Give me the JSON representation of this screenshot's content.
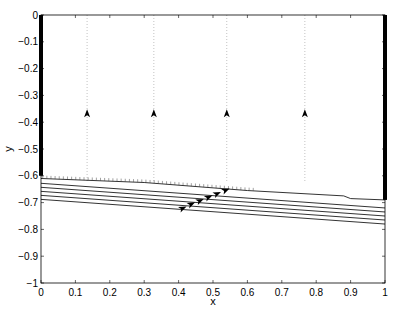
{
  "chart_data": {
    "type": "line",
    "title": "",
    "xlabel": "x",
    "ylabel": "y",
    "xlim": [
      0,
      1
    ],
    "ylim": [
      -1,
      0
    ],
    "grid": false,
    "x_ticks": [
      "0",
      "0.1",
      "0.2",
      "0.3",
      "0.4",
      "0.5",
      "0.6",
      "0.7",
      "0.8",
      "0.9",
      "1"
    ],
    "y_ticks": [
      "0",
      "-0.1",
      "-0.2",
      "-0.3",
      "-0.4",
      "-0.5",
      "-0.6",
      "-0.7",
      "-0.8",
      "-0.9",
      "-1"
    ],
    "series": [
      {
        "name": "interface",
        "style": "solid-hatched",
        "x": [
          0,
          0.3,
          0.6,
          0.88,
          0.9,
          1
        ],
        "y": [
          -0.61,
          -0.625,
          -0.655,
          -0.675,
          -0.685,
          -0.69
        ]
      },
      {
        "name": "streamline-1",
        "x": [
          0,
          1
        ],
        "y": [
          -0.628,
          -0.72
        ]
      },
      {
        "name": "streamline-2",
        "x": [
          0,
          1
        ],
        "y": [
          -0.643,
          -0.735
        ]
      },
      {
        "name": "streamline-3",
        "x": [
          0,
          1
        ],
        "y": [
          -0.658,
          -0.75
        ]
      },
      {
        "name": "streamline-4",
        "x": [
          0,
          1
        ],
        "y": [
          -0.673,
          -0.765
        ]
      },
      {
        "name": "streamline-5",
        "x": [
          0,
          1
        ],
        "y": [
          -0.688,
          -0.78
        ]
      }
    ],
    "vertical_dotted_lines_x": [
      0.134,
      0.328,
      0.54,
      0.767
    ],
    "upward_arrows": [
      {
        "x": 0.134,
        "y": -0.37
      },
      {
        "x": 0.328,
        "y": -0.37
      },
      {
        "x": 0.54,
        "y": -0.37
      },
      {
        "x": 0.767,
        "y": -0.37
      }
    ],
    "diagonal_arrows": [
      {
        "x": 0.41,
        "y": -0.722
      },
      {
        "x": 0.435,
        "y": -0.707
      },
      {
        "x": 0.46,
        "y": -0.694
      },
      {
        "x": 0.485,
        "y": -0.681
      },
      {
        "x": 0.51,
        "y": -0.668
      },
      {
        "x": 0.535,
        "y": -0.655
      }
    ],
    "wall_segments": [
      {
        "side": "left",
        "x": 0,
        "y_from": 0,
        "y_to": -0.6
      },
      {
        "side": "right",
        "x": 1,
        "y_from": 0,
        "y_to": -0.69
      }
    ]
  }
}
